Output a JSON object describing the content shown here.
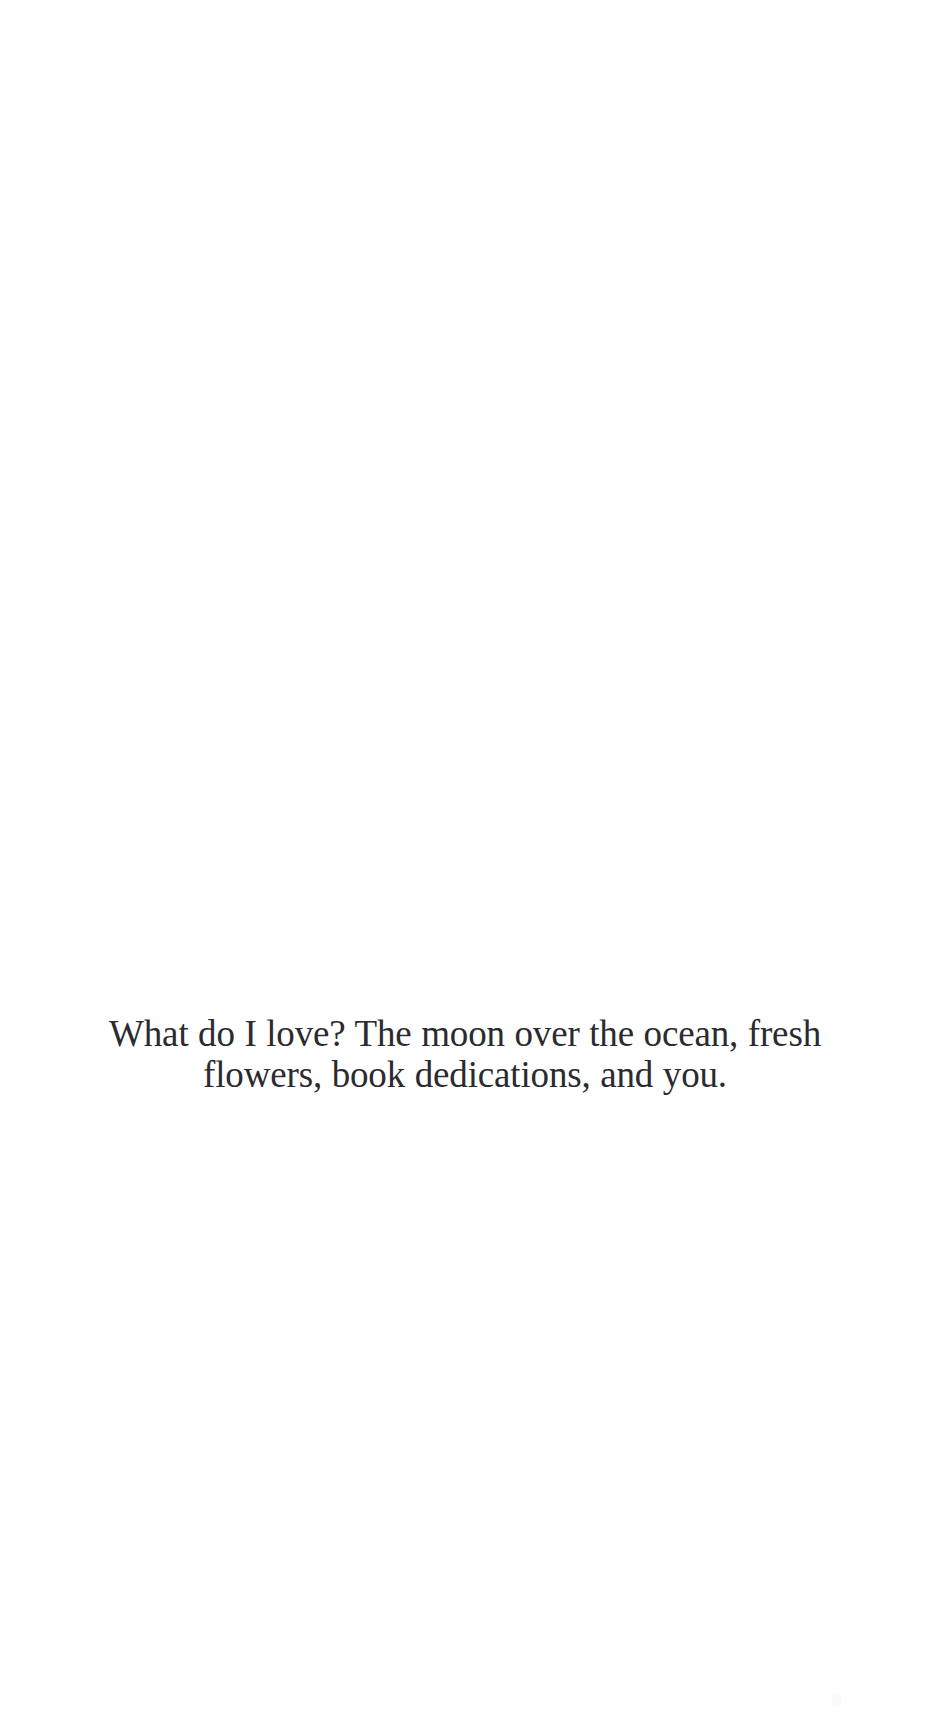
{
  "page": {
    "background_color": "#ffffff",
    "width_px": 930,
    "height_px": 1731,
    "kind": "scanned-book-page"
  },
  "epigraph": {
    "text": "What do I love? The moon over the ocean, fresh flowers, book dedications, and you.",
    "lines": [
      "What do I love? The moon over the ocean, fresh flowers, book",
      "dedications, and you."
    ],
    "text_color": "#2b2b2f",
    "alignment": "center"
  },
  "artifact": {
    "name": "scan-speck",
    "color": "#fbfbfc"
  }
}
